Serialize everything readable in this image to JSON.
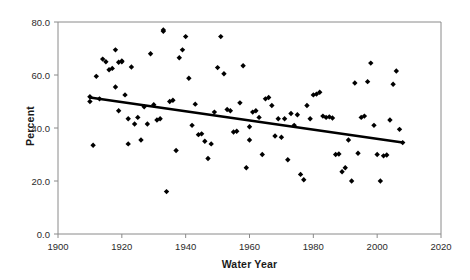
{
  "chart_data": {
    "type": "scatter",
    "title": "",
    "xlabel": "Water Year",
    "ylabel": "Percent",
    "xlim": [
      1900,
      2020
    ],
    "ylim": [
      0.0,
      80.0
    ],
    "xticks": [
      1900,
      1920,
      1940,
      1960,
      1980,
      2000,
      2020
    ],
    "xtick_labels": [
      "1900",
      "1920",
      "1940",
      "1960",
      "1980",
      "2000",
      "2020"
    ],
    "yticks": [
      0.0,
      20.0,
      40.0,
      60.0,
      80.0
    ],
    "ytick_labels": [
      "0.0",
      "20.0",
      "40.0",
      "60.0",
      "80.0"
    ],
    "grid": false,
    "legend": false,
    "marker": "diamond",
    "marker_color": "#000000",
    "series": [
      {
        "name": "Percent",
        "marker": "diamond",
        "color": "#000000",
        "points": [
          [
            1910,
            51.8
          ],
          [
            1910,
            50.0
          ],
          [
            1911,
            33.5
          ],
          [
            1912,
            59.5
          ],
          [
            1913,
            51.0
          ],
          [
            1914,
            66.0
          ],
          [
            1915,
            65.0
          ],
          [
            1916,
            62.0
          ],
          [
            1917,
            62.5
          ],
          [
            1918,
            69.5
          ],
          [
            1918,
            55.5
          ],
          [
            1919,
            64.8
          ],
          [
            1919,
            46.5
          ],
          [
            1920,
            65.0
          ],
          [
            1920,
            65.3
          ],
          [
            1921,
            52.5
          ],
          [
            1922,
            43.5
          ],
          [
            1922,
            34.0
          ],
          [
            1923,
            63.0
          ],
          [
            1924,
            41.5
          ],
          [
            1925,
            44.0
          ],
          [
            1926,
            35.5
          ],
          [
            1927,
            48.0
          ],
          [
            1928,
            41.5
          ],
          [
            1929,
            68.0
          ],
          [
            1930,
            48.8
          ],
          [
            1931,
            43.0
          ],
          [
            1932,
            43.5
          ],
          [
            1933,
            76.5
          ],
          [
            1933,
            77.0
          ],
          [
            1934,
            16.0
          ],
          [
            1935,
            50.0
          ],
          [
            1936,
            50.5
          ],
          [
            1937,
            31.5
          ],
          [
            1938,
            66.5
          ],
          [
            1939,
            69.5
          ],
          [
            1940,
            74.5
          ],
          [
            1941,
            58.8
          ],
          [
            1942,
            41.0
          ],
          [
            1943,
            49.0
          ],
          [
            1944,
            37.5
          ],
          [
            1945,
            37.8
          ],
          [
            1946,
            35.0
          ],
          [
            1947,
            28.5
          ],
          [
            1948,
            34.0
          ],
          [
            1949,
            46.0
          ],
          [
            1950,
            62.8
          ],
          [
            1951,
            74.5
          ],
          [
            1952,
            60.5
          ],
          [
            1953,
            47.0
          ],
          [
            1954,
            46.5
          ],
          [
            1955,
            38.5
          ],
          [
            1956,
            38.8
          ],
          [
            1957,
            49.5
          ],
          [
            1958,
            63.5
          ],
          [
            1959,
            25.0
          ],
          [
            1960,
            35.5
          ],
          [
            1960,
            40.5
          ],
          [
            1961,
            46.0
          ],
          [
            1962,
            46.5
          ],
          [
            1963,
            44.0
          ],
          [
            1964,
            30.0
          ],
          [
            1965,
            51.0
          ],
          [
            1966,
            51.5
          ],
          [
            1967,
            48.5
          ],
          [
            1968,
            37.0
          ],
          [
            1969,
            43.5
          ],
          [
            1970,
            36.5
          ],
          [
            1971,
            43.5
          ],
          [
            1972,
            28.0
          ],
          [
            1973,
            45.5
          ],
          [
            1974,
            41.0
          ],
          [
            1975,
            45.0
          ],
          [
            1976,
            22.5
          ],
          [
            1977,
            20.5
          ],
          [
            1978,
            48.5
          ],
          [
            1979,
            43.5
          ],
          [
            1980,
            52.5
          ],
          [
            1981,
            52.8
          ],
          [
            1982,
            53.5
          ],
          [
            1983,
            44.5
          ],
          [
            1984,
            44.0
          ],
          [
            1985,
            44.2
          ],
          [
            1986,
            43.8
          ],
          [
            1987,
            30.0
          ],
          [
            1988,
            30.2
          ],
          [
            1989,
            23.5
          ],
          [
            1990,
            25.0
          ],
          [
            1991,
            35.5
          ],
          [
            1992,
            20.0
          ],
          [
            1993,
            57.0
          ],
          [
            1994,
            30.5
          ],
          [
            1995,
            44.0
          ],
          [
            1996,
            44.5
          ],
          [
            1997,
            57.5
          ],
          [
            1998,
            64.5
          ],
          [
            1999,
            41.0
          ],
          [
            2000,
            30.0
          ],
          [
            2001,
            20.0
          ],
          [
            2002,
            29.5
          ],
          [
            2003,
            29.8
          ],
          [
            2004,
            43.0
          ],
          [
            2005,
            56.5
          ],
          [
            2006,
            61.5
          ],
          [
            2007,
            39.5
          ],
          [
            2008,
            34.5
          ]
        ]
      }
    ],
    "trendline": {
      "name": "linear trend",
      "color": "#000000",
      "x_start": 1910,
      "y_start": 51.5,
      "x_end": 2008,
      "y_end": 34.5
    }
  }
}
